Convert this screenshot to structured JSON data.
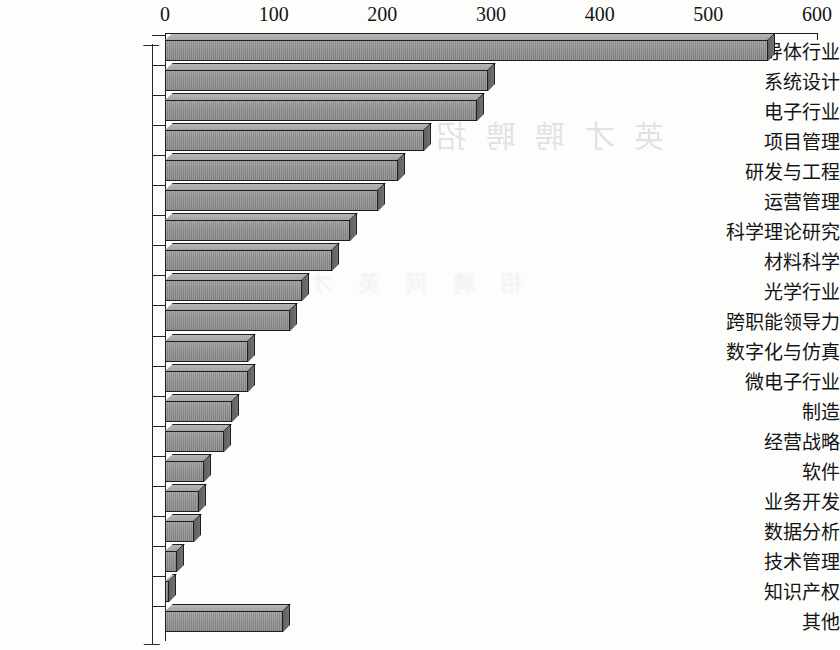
{
  "chart_data": {
    "type": "bar",
    "orientation": "horizontal",
    "title": "",
    "subtitle": "",
    "xlabel": "",
    "ylabel": "",
    "xlim": [
      0,
      600
    ],
    "xticks": [
      0,
      100,
      200,
      300,
      400,
      500,
      600
    ],
    "xtick_labels": [
      "0",
      "100",
      "200",
      "300",
      "400",
      "500",
      "600"
    ],
    "grid": false,
    "legend": null,
    "style": "3d-bar",
    "bar_color": "#8d8d8d",
    "bar_outline_color": "#1e1e1e",
    "background_color": "#ffffff",
    "categories": [
      "半导体行业",
      "系统设计",
      "电子行业",
      "项目管理",
      "研发与工程",
      "运营管理",
      "科学理论研究",
      "材料科学",
      "光学行业",
      "跨职能领导力",
      "数字化与仿真",
      "微电子行业",
      "制造",
      "经营战略",
      "软件",
      "业务开发",
      "数据分析",
      "技术管理",
      "知识产权",
      "其他"
    ],
    "values": [
      555,
      297,
      287,
      238,
      214,
      196,
      170,
      154,
      126,
      115,
      76,
      76,
      62,
      54,
      36,
      31,
      27,
      11,
      4,
      109
    ]
  },
  "watermark": {
    "line1": "英 才 聘 聘 招",
    "line2": "招 聘 网 英 才"
  }
}
